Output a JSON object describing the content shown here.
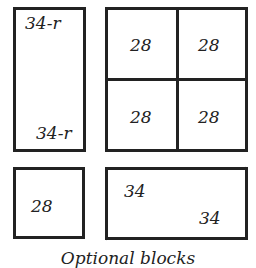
{
  "diagram": {
    "blocks": [
      {
        "id": "tall-rect",
        "labels": [
          "34-r",
          "34-r"
        ],
        "diagonal": true
      },
      {
        "id": "grid-2x2",
        "labels": [
          "28",
          "28",
          "28",
          "28"
        ]
      },
      {
        "id": "small-square",
        "labels": [
          "28"
        ]
      },
      {
        "id": "wide-rect",
        "labels": [
          "34",
          "34"
        ],
        "diagonal": true
      }
    ],
    "caption": "Optional blocks"
  }
}
